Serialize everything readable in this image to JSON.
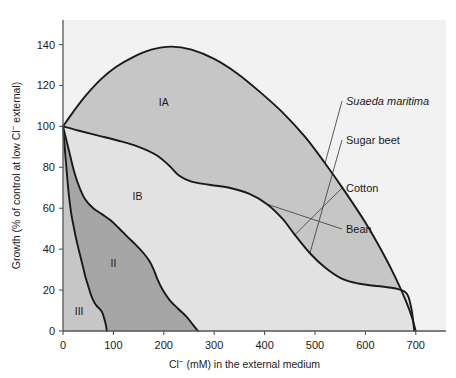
{
  "figure": {
    "background_color": "#ffffff",
    "plot_background_color": "#f2f2f2",
    "axis_color": "#555555",
    "curve_color": "#1a1a1a",
    "leader_color": "#4a4a4a"
  },
  "chart_data": {
    "type": "area",
    "title": "",
    "xlabel_parts": {
      "ion": "Cl",
      "charge": "−",
      "rest": " (mM) in the external medium"
    },
    "ylabel_parts": {
      "lead": "Growth (% of control at low Cl",
      "charge": "−",
      "rest": " external)"
    },
    "xlabel": "Cl− (mM) in the external medium",
    "ylabel": "Growth (% of control at low Cl− external)",
    "xlim": [
      0,
      760
    ],
    "ylim": [
      0,
      152
    ],
    "xticks": [
      0,
      100,
      200,
      300,
      400,
      500,
      600,
      700
    ],
    "yticks": [
      0,
      20,
      40,
      60,
      80,
      100,
      120,
      140
    ],
    "grid": false,
    "legend_position": "right-callouts",
    "series": [
      {
        "name": "Suaeda maritima",
        "italic": true,
        "points": [
          [
            0,
            100
          ],
          [
            20,
            107
          ],
          [
            45,
            115
          ],
          [
            75,
            123
          ],
          [
            105,
            129
          ],
          [
            140,
            134
          ],
          [
            175,
            137.5
          ],
          [
            215,
            139
          ],
          [
            255,
            137.5
          ],
          [
            300,
            133
          ],
          [
            345,
            126
          ],
          [
            390,
            117
          ],
          [
            435,
            107
          ],
          [
            480,
            95
          ],
          [
            520,
            82
          ],
          [
            560,
            68
          ],
          [
            600,
            53
          ],
          [
            635,
            38
          ],
          [
            660,
            26
          ],
          [
            680,
            15
          ],
          [
            692,
            7
          ],
          [
            700,
            0
          ]
        ]
      },
      {
        "name": "Sugar beet",
        "italic": false,
        "points": [
          [
            0,
            100
          ],
          [
            30,
            98
          ],
          [
            70,
            95.5
          ],
          [
            110,
            93
          ],
          [
            150,
            90
          ],
          [
            185,
            86
          ],
          [
            210,
            81
          ],
          [
            230,
            76
          ],
          [
            255,
            73
          ],
          [
            290,
            71.5
          ],
          [
            330,
            70
          ],
          [
            370,
            67
          ],
          [
            405,
            62
          ],
          [
            435,
            55
          ],
          [
            460,
            47
          ],
          [
            490,
            38
          ],
          [
            520,
            31
          ],
          [
            550,
            26
          ],
          [
            580,
            23.5
          ],
          [
            605,
            22.5
          ],
          [
            640,
            21.5
          ],
          [
            665,
            20.5
          ],
          [
            683,
            18
          ],
          [
            692,
            10
          ],
          [
            697,
            0
          ]
        ]
      },
      {
        "name": "Cotton",
        "italic": false,
        "points": [
          [
            0,
            100
          ],
          [
            12,
            88
          ],
          [
            22,
            78
          ],
          [
            33,
            70
          ],
          [
            45,
            64
          ],
          [
            60,
            60
          ],
          [
            78,
            57
          ],
          [
            95,
            54
          ],
          [
            112,
            50
          ],
          [
            128,
            46
          ],
          [
            145,
            42
          ],
          [
            160,
            38
          ],
          [
            172,
            34
          ],
          [
            180,
            30
          ],
          [
            188,
            25
          ],
          [
            198,
            20
          ],
          [
            212,
            15
          ],
          [
            228,
            11
          ],
          [
            245,
            7
          ],
          [
            258,
            3
          ],
          [
            268,
            0
          ]
        ]
      },
      {
        "name": "Bean",
        "italic": false,
        "points": [
          [
            0,
            100
          ],
          [
            6,
            82
          ],
          [
            11,
            68
          ],
          [
            16,
            58
          ],
          [
            22,
            50
          ],
          [
            28,
            43
          ],
          [
            34,
            37
          ],
          [
            40,
            31
          ],
          [
            45,
            26
          ],
          [
            50,
            22
          ],
          [
            55,
            18
          ],
          [
            60,
            15
          ],
          [
            66,
            12.5
          ],
          [
            72,
            11
          ],
          [
            78,
            9
          ],
          [
            82,
            6
          ],
          [
            85,
            3
          ],
          [
            87,
            0
          ]
        ]
      }
    ],
    "regions": [
      {
        "id": "IA",
        "label": "IA",
        "fill": "#c6c6c6",
        "label_x": 200,
        "label_y": 112
      },
      {
        "id": "IB",
        "label": "IB",
        "fill": "#e2e2e2",
        "label_x": 148,
        "label_y": 66
      },
      {
        "id": "II",
        "label": "II",
        "fill": "#a6a6a6",
        "label_x": 100,
        "label_y": 33
      },
      {
        "id": "III",
        "label": "III",
        "fill": "#c6c6c6",
        "label_x": 32,
        "label_y": 10
      }
    ],
    "callouts": [
      {
        "label": "Suaeda maritima",
        "italic": true,
        "anchor_x": 520,
        "anchor_y": 82
      },
      {
        "label": "Sugar beet",
        "italic": false,
        "anchor_x": 490,
        "anchor_y": 38
      },
      {
        "label": "Cotton",
        "italic": false,
        "anchor_x": 460,
        "anchor_y": 47
      },
      {
        "label": "Bean",
        "italic": false,
        "anchor_x": 405,
        "anchor_y": 62
      }
    ]
  }
}
